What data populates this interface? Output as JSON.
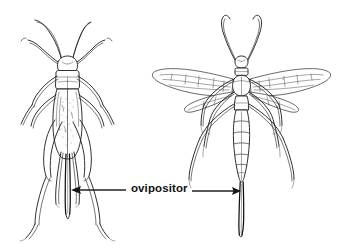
{
  "figure": {
    "title": "",
    "background_color": "#ffffff",
    "ink_color": "#1a1a1a",
    "width": 359,
    "height": 248,
    "style": "black-and-white line drawing"
  },
  "annotation": {
    "label": "ovipositor",
    "label_color": "#111111",
    "left_arrow": {
      "direction": "left",
      "from_x": 126,
      "to_x": 72,
      "y": 190,
      "points_to": "cricket-ovipositor"
    },
    "right_arrow": {
      "direction": "right",
      "from_x": 192,
      "to_x": 241,
      "y": 191,
      "points_to": "wasp-ovipositor"
    }
  },
  "specimens": [
    {
      "id": "cricket",
      "common_name": "cricket",
      "view": "dorsal",
      "position": "left",
      "parts": [
        "antennae",
        "head",
        "pronotum",
        "forewings",
        "legs",
        "hind-legs",
        "cerci",
        "ovipositor"
      ]
    },
    {
      "id": "wasp",
      "common_name": "ichneumon wasp",
      "view": "dorsal",
      "position": "right",
      "parts": [
        "antennae",
        "head",
        "thorax",
        "forewings",
        "hindwings",
        "legs",
        "segmented-abdomen",
        "ovipositor"
      ]
    }
  ]
}
